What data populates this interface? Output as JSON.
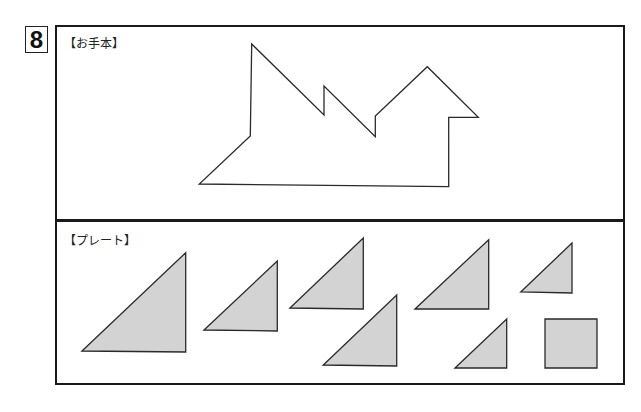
{
  "problem": {
    "number": "8"
  },
  "sections": {
    "model": {
      "label": "【お手本】"
    },
    "plate": {
      "label": "【プレート】"
    }
  },
  "colors": {
    "stroke": "#2a2a2a",
    "piece_fill": "#d3d3d3",
    "frame": "#1a1a1a"
  },
  "model_shape": {
    "points": "251.7,44 324,115 324,86 375.3,136.7 375.3,116 427.3,66.7 478.3,117.3 448.7,117.3 448.7,186.7 199.3,184 250.3,136"
  },
  "pieces": [
    {
      "name": "large-triangle",
      "points": "82,351 185.7,252.7 185.7,352"
    },
    {
      "name": "medium-triangle-1",
      "points": "204,330 277.3,261 277.3,331"
    },
    {
      "name": "medium-triangle-2",
      "points": "290,308 363.3,238 363.3,309"
    },
    {
      "name": "medium-triangle-3",
      "points": "323.3,365 396.7,295 396.7,366"
    },
    {
      "name": "medium-triangle-4",
      "points": "415,309 488.7,239.7 488.7,309"
    },
    {
      "name": "small-triangle-1",
      "points": "520.7,292 572,243 572,293"
    },
    {
      "name": "small-triangle-2",
      "points": "455,368 506.7,319 506.7,368"
    },
    {
      "name": "square",
      "points": "545,319 597,319 597,368 545,368"
    }
  ]
}
